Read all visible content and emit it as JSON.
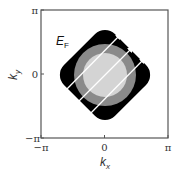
{
  "diagram": {
    "label": {
      "fermi_energy": "E",
      "fermi_energy_sub": "F"
    },
    "axes": {
      "x": {
        "label": "k",
        "label_sub": "x",
        "ticks": [
          "−π",
          "0",
          "π"
        ]
      },
      "y": {
        "label": "k",
        "label_sub": "y",
        "ticks": [
          "−π",
          "0",
          "π"
        ]
      }
    },
    "colors": {
      "outer_region": "#000000",
      "middle_ring": "#8a8a8a",
      "inner_disk": "#d4d4d4",
      "arrows": "#ffffff",
      "frame": "#555555"
    },
    "arrows": [
      {
        "from": [
          64,
          92
        ],
        "to": [
          121,
          34
        ]
      },
      {
        "from": [
          76,
          104
        ],
        "to": [
          133,
          47
        ]
      },
      {
        "from": [
          88,
          116
        ],
        "to": [
          145,
          58
        ]
      }
    ]
  }
}
